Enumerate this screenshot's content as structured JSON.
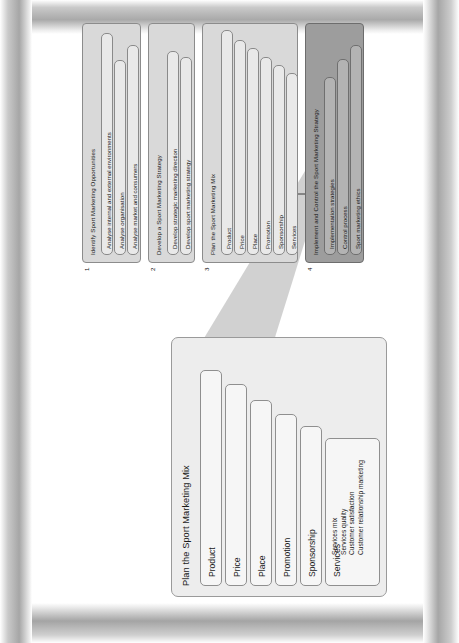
{
  "diagram": {
    "orientation": "rotated-90",
    "colors": {
      "stage_fill": "#d9d9d9",
      "stage_final_fill": "#9d9d9d",
      "detail_fill": "#ededed",
      "subbox_fill": "#e9e9e9",
      "border": "#8c8c8c"
    }
  },
  "detail_panel": {
    "name": "zoom-callout",
    "title": "Plan the Sport Marketing Mix",
    "items": [
      {
        "label": "Product",
        "details": []
      },
      {
        "label": "Price",
        "details": []
      },
      {
        "label": "Place",
        "details": []
      },
      {
        "label": "Promotion",
        "details": []
      },
      {
        "label": "Sponsorship",
        "details": []
      },
      {
        "label": "Services",
        "details": [
          "Services mix",
          "Services quality",
          "Customer satisfaction",
          "Customer relationship marketing"
        ]
      }
    ]
  },
  "stages": [
    {
      "number": "1",
      "title": "Identify Sport Marketing Opportunities",
      "items": [
        "Analyse internal and external environments",
        "Analyse organisation",
        "Analyse market and consumers"
      ]
    },
    {
      "number": "2",
      "title": "Develop a Sport Marketing Strategy",
      "items": [
        "Develop strategic marketing direction",
        "Develop sport marketing strategy"
      ]
    },
    {
      "number": "3",
      "title": "Plan the Sport Marketing Mix",
      "items": [
        "Product",
        "Price",
        "Place",
        "Promotion",
        "Sponsorship",
        "Services"
      ]
    },
    {
      "number": "4",
      "title": "Implement and Control the Sport Marketing Strategy",
      "items": [
        "Implementation strategies",
        "Control process",
        "Sport marketing ethics"
      ]
    }
  ],
  "connector": {
    "name": "feedback-arrow",
    "from": "stage-4",
    "to": "stage-1"
  }
}
